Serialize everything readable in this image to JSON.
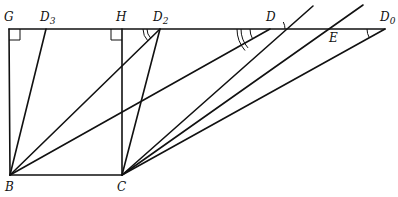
{
  "diagram": {
    "type": "geometry",
    "points": {
      "G": {
        "label": "G",
        "x": 9,
        "y": 29
      },
      "D3": {
        "label": "D",
        "sub": "3",
        "x": 46,
        "y": 29
      },
      "H": {
        "label": "H",
        "x": 122,
        "y": 29
      },
      "D2": {
        "label": "D",
        "sub": "2",
        "x": 160,
        "y": 29
      },
      "D": {
        "label": "D",
        "x": 270,
        "y": 29
      },
      "E": {
        "label": "E",
        "x": 331,
        "y": 29
      },
      "D0": {
        "label": "D",
        "sub": "0",
        "x": 385,
        "y": 29
      },
      "B": {
        "label": "B",
        "x": 10,
        "y": 175
      },
      "C": {
        "label": "C",
        "x": 122,
        "y": 175
      }
    },
    "segments": [
      [
        "G",
        "D0"
      ],
      [
        "G",
        "B"
      ],
      [
        "H",
        "C"
      ],
      [
        "B",
        "C"
      ],
      [
        "B",
        "D3"
      ],
      [
        "B",
        "D2"
      ],
      [
        "B",
        "D"
      ],
      [
        "C",
        "D2"
      ],
      [
        "C",
        "D"
      ],
      [
        "C",
        "E"
      ],
      [
        "C",
        "D0"
      ]
    ],
    "right_angles": [
      "G",
      "H"
    ],
    "angle_marks": [
      "D2 (double arc)",
      "D (single + double arc)",
      "D (upper single arc)",
      "D0 (single arc)"
    ]
  }
}
